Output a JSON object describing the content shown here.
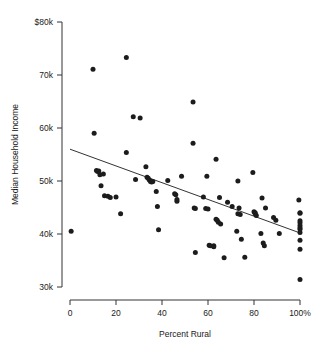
{
  "chart_data": {
    "type": "scatter",
    "title": "",
    "xlabel": "Percent Rural",
    "ylabel": "Median Household Income",
    "xlim": [
      0,
      100
    ],
    "ylim": [
      30000,
      80000
    ],
    "grid": false,
    "legend": null,
    "xticks": [
      0,
      20,
      40,
      60,
      80,
      100
    ],
    "xticklabels": [
      "0",
      "20",
      "40",
      "60",
      "80",
      "100%"
    ],
    "yticks": [
      30000,
      40000,
      50000,
      60000,
      70000,
      80000
    ],
    "yticklabels": [
      "30k",
      "40k",
      "50k",
      "60k",
      "70k",
      "$80k"
    ],
    "marker": "filled-circle",
    "marker_color": "#1c1c1c",
    "trendline": {
      "type": "linear",
      "x": [
        0,
        100
      ],
      "y": [
        56000,
        40200
      ],
      "color": "#1c1c1c"
    },
    "points": [
      [
        0.5,
        40500
      ],
      [
        10.0,
        71100
      ],
      [
        10.5,
        59000
      ],
      [
        11.5,
        52000
      ],
      [
        12.0,
        51800
      ],
      [
        12.5,
        51900
      ],
      [
        13.0,
        51200
      ],
      [
        13.5,
        49100
      ],
      [
        14.5,
        51300
      ],
      [
        15.0,
        47200
      ],
      [
        16.5,
        47100
      ],
      [
        17.5,
        46900
      ],
      [
        20.0,
        47000
      ],
      [
        22.0,
        43800
      ],
      [
        24.5,
        73300
      ],
      [
        24.5,
        55400
      ],
      [
        27.5,
        62100
      ],
      [
        28.5,
        50300
      ],
      [
        30.5,
        61900
      ],
      [
        33.0,
        52700
      ],
      [
        33.5,
        50700
      ],
      [
        34.0,
        50500
      ],
      [
        34.5,
        50200
      ],
      [
        35.0,
        49900
      ],
      [
        35.5,
        49800
      ],
      [
        36.0,
        49900
      ],
      [
        37.5,
        48000
      ],
      [
        38.0,
        45200
      ],
      [
        38.5,
        40800
      ],
      [
        42.5,
        50100
      ],
      [
        45.5,
        47600
      ],
      [
        46.0,
        47400
      ],
      [
        46.5,
        46500
      ],
      [
        46.5,
        46200
      ],
      [
        48.5,
        50900
      ],
      [
        53.5,
        64900
      ],
      [
        53.5,
        57100
      ],
      [
        54.0,
        44900
      ],
      [
        54.5,
        44800
      ],
      [
        54.5,
        36500
      ],
      [
        58.0,
        47000
      ],
      [
        59.0,
        44800
      ],
      [
        59.5,
        50900
      ],
      [
        60.0,
        44700
      ],
      [
        60.5,
        37900
      ],
      [
        61.0,
        37800
      ],
      [
        62.5,
        37800
      ],
      [
        62.5,
        37600
      ],
      [
        63.5,
        54100
      ],
      [
        63.5,
        42800
      ],
      [
        64.0,
        42600
      ],
      [
        64.5,
        42200
      ],
      [
        65.0,
        46900
      ],
      [
        65.5,
        41900
      ],
      [
        67.0,
        35500
      ],
      [
        68.5,
        46000
      ],
      [
        70.5,
        45200
      ],
      [
        72.5,
        40500
      ],
      [
        73.0,
        50000
      ],
      [
        73.0,
        43800
      ],
      [
        73.5,
        44900
      ],
      [
        74.0,
        43700
      ],
      [
        74.5,
        39000
      ],
      [
        76.0,
        35600
      ],
      [
        79.5,
        51600
      ],
      [
        80.0,
        44200
      ],
      [
        80.5,
        43800
      ],
      [
        80.5,
        44000
      ],
      [
        81.0,
        43500
      ],
      [
        83.0,
        40100
      ],
      [
        83.5,
        46800
      ],
      [
        84.0,
        38300
      ],
      [
        84.5,
        37800
      ],
      [
        85.0,
        44900
      ],
      [
        88.5,
        43100
      ],
      [
        89.5,
        42600
      ],
      [
        91.0,
        40100
      ],
      [
        99.5,
        46400
      ],
      [
        100.0,
        44000
      ],
      [
        100.0,
        43900
      ],
      [
        100.0,
        42500
      ],
      [
        100.0,
        42100
      ],
      [
        100.0,
        41600
      ],
      [
        100.0,
        41200
      ],
      [
        100.0,
        40900
      ],
      [
        100.0,
        40300
      ],
      [
        100.0,
        38800
      ],
      [
        100.0,
        37100
      ],
      [
        100.0,
        31400
      ]
    ]
  }
}
